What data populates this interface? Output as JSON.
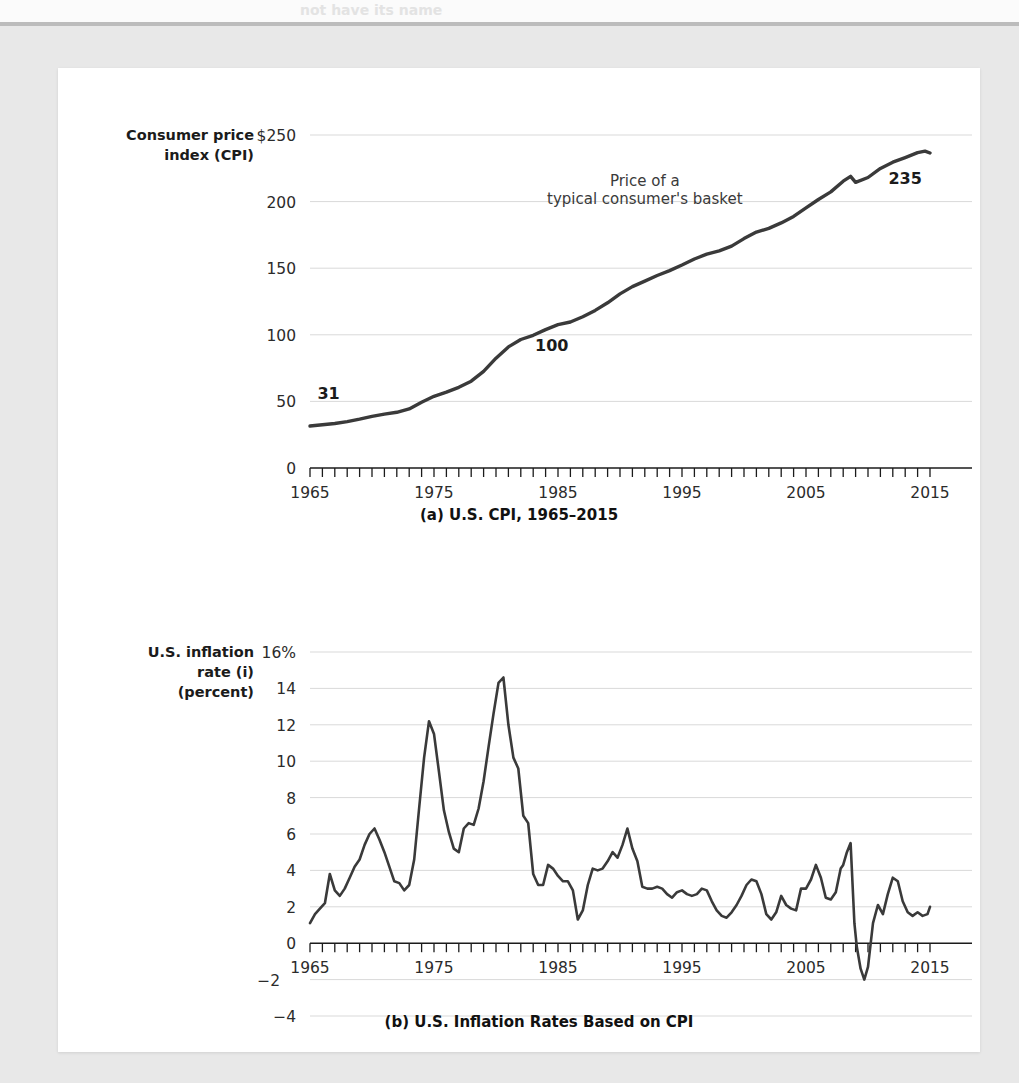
{
  "page": {
    "background_color": "#e8e8e8",
    "card_color": "#ffffff",
    "ghost_text_top": "not have its name",
    "ghost_text_right": "is even"
  },
  "chart_data": [
    {
      "type": "line",
      "id": "cpi",
      "title": "",
      "caption": "(a) U.S. CPI, 1965–2015",
      "ylabel_line1": "Consumer price",
      "ylabel_line2": "index (CPI)",
      "xlabel": "",
      "ytick_labels": [
        "$250",
        "200",
        "150",
        "100",
        "50",
        "0"
      ],
      "ytick_values": [
        250,
        200,
        150,
        100,
        50,
        0
      ],
      "xtick_labels": [
        "1965",
        "1975",
        "1985",
        "1995",
        "2005",
        "2015"
      ],
      "xtick_values": [
        1965,
        1975,
        1985,
        1995,
        2005,
        2015
      ],
      "xlim": [
        1965,
        2015
      ],
      "ylim": [
        0,
        250
      ],
      "grid": true,
      "legend": "none",
      "annotations": [
        {
          "text": "Price of a",
          "x": 1992,
          "y": 212
        },
        {
          "text": "typical consumer's basket",
          "x": 1992,
          "y": 198
        },
        {
          "text": "31",
          "x": 1966.5,
          "y": 52
        },
        {
          "text": "100",
          "x": 1984.5,
          "y": 88
        },
        {
          "text": "235",
          "x": 2013,
          "y": 213
        }
      ],
      "series_name": "U.S. Consumer Price Index",
      "x": [
        1965,
        1966,
        1967,
        1968,
        1969,
        1970,
        1971,
        1972,
        1973,
        1974,
        1975,
        1976,
        1977,
        1978,
        1979,
        1980,
        1981,
        1982,
        1983,
        1984,
        1985,
        1986,
        1987,
        1988,
        1989,
        1990,
        1991,
        1992,
        1993,
        1994,
        1995,
        1996,
        1997,
        1998,
        1999,
        2000,
        2001,
        2002,
        2003,
        2004,
        2005,
        2006,
        2007,
        2008,
        2008.6,
        2009,
        2010,
        2011,
        2012,
        2013,
        2014,
        2014.6,
        2015
      ],
      "values": [
        31.5,
        32.4,
        33.4,
        34.8,
        36.7,
        38.8,
        40.5,
        41.8,
        44.4,
        49.3,
        53.8,
        56.9,
        60.6,
        65.2,
        72.6,
        82.4,
        90.9,
        96.5,
        99.6,
        103.9,
        107.6,
        109.6,
        113.6,
        118.3,
        124.0,
        130.7,
        136.2,
        140.3,
        144.5,
        148.2,
        152.4,
        156.9,
        160.5,
        163.0,
        166.6,
        172.2,
        177.1,
        179.9,
        184.0,
        188.9,
        195.3,
        201.6,
        207.3,
        215.3,
        219.0,
        214.5,
        218.1,
        224.9,
        229.6,
        233.0,
        236.7,
        237.9,
        236.5
      ]
    },
    {
      "type": "line",
      "id": "inflation",
      "title": "",
      "caption": "(b) U.S. Inflation Rates Based on CPI",
      "ylabel_line1": "U.S. inflation",
      "ylabel_line2": "rate (i)",
      "ylabel_line3": "(percent)",
      "xlabel": "",
      "ytick_labels": [
        "16%",
        "14",
        "12",
        "10",
        "8",
        "6",
        "4",
        "2",
        "0",
        "−2",
        "−4"
      ],
      "ytick_values": [
        16,
        14,
        12,
        10,
        8,
        6,
        4,
        2,
        0,
        -2,
        -4
      ],
      "xtick_labels": [
        "1965",
        "1975",
        "1985",
        "1995",
        "2005",
        "2015"
      ],
      "xtick_values": [
        1965,
        1975,
        1985,
        1995,
        2005,
        2015
      ],
      "xlim": [
        1965,
        2015
      ],
      "ylim": [
        -4,
        16
      ],
      "grid": true,
      "legend": "none",
      "annotations": [],
      "series_name": "U.S. inflation rate (percent)",
      "x": [
        1965.0,
        1965.4,
        1965.8,
        1966.2,
        1966.6,
        1967.0,
        1967.4,
        1967.8,
        1968.2,
        1968.6,
        1969.0,
        1969.4,
        1969.8,
        1970.2,
        1970.6,
        1971.0,
        1971.4,
        1971.8,
        1972.2,
        1972.6,
        1973.0,
        1973.4,
        1973.8,
        1974.2,
        1974.6,
        1975.0,
        1975.4,
        1975.8,
        1976.2,
        1976.6,
        1977.0,
        1977.4,
        1977.8,
        1978.2,
        1978.6,
        1979.0,
        1979.4,
        1979.8,
        1980.2,
        1980.6,
        1981.0,
        1981.4,
        1981.8,
        1982.2,
        1982.6,
        1983.0,
        1983.4,
        1983.8,
        1984.2,
        1984.6,
        1985.0,
        1985.4,
        1985.8,
        1986.2,
        1986.6,
        1987.0,
        1987.4,
        1987.8,
        1988.2,
        1988.6,
        1989.0,
        1989.4,
        1989.8,
        1990.2,
        1990.6,
        1991.0,
        1991.4,
        1991.8,
        1992.2,
        1992.6,
        1993.0,
        1993.4,
        1993.8,
        1994.2,
        1994.6,
        1995.0,
        1995.4,
        1995.8,
        1996.2,
        1996.6,
        1997.0,
        1997.4,
        1997.8,
        1998.2,
        1998.6,
        1999.0,
        1999.4,
        1999.8,
        2000.2,
        2000.6,
        2001.0,
        2001.4,
        2001.8,
        2002.2,
        2002.6,
        2003.0,
        2003.4,
        2003.8,
        2004.2,
        2004.6,
        2005.0,
        2005.4,
        2005.8,
        2006.2,
        2006.6,
        2007.0,
        2007.4,
        2007.8,
        2008.0,
        2008.3,
        2008.6,
        2008.9,
        2009.1,
        2009.4,
        2009.7,
        2010.0,
        2010.4,
        2010.8,
        2011.2,
        2011.6,
        2012.0,
        2012.4,
        2012.8,
        2013.2,
        2013.6,
        2014.0,
        2014.4,
        2014.8,
        2015.0
      ],
      "values": [
        1.1,
        1.6,
        1.9,
        2.2,
        3.8,
        2.9,
        2.6,
        3.0,
        3.6,
        4.2,
        4.6,
        5.4,
        6.0,
        6.3,
        5.7,
        5.0,
        4.2,
        3.4,
        3.3,
        2.9,
        3.2,
        4.6,
        7.4,
        10.2,
        12.2,
        11.5,
        9.4,
        7.3,
        6.1,
        5.2,
        5.0,
        6.3,
        6.6,
        6.5,
        7.4,
        8.9,
        10.8,
        12.6,
        14.3,
        14.6,
        12.0,
        10.2,
        9.6,
        7.0,
        6.6,
        3.8,
        3.2,
        3.2,
        4.3,
        4.1,
        3.7,
        3.4,
        3.4,
        2.9,
        1.3,
        1.8,
        3.2,
        4.1,
        4.0,
        4.1,
        4.5,
        5.0,
        4.7,
        5.4,
        6.3,
        5.2,
        4.5,
        3.1,
        3.0,
        3.0,
        3.1,
        3.0,
        2.7,
        2.5,
        2.8,
        2.9,
        2.7,
        2.6,
        2.7,
        3.0,
        2.9,
        2.3,
        1.8,
        1.5,
        1.4,
        1.7,
        2.1,
        2.6,
        3.2,
        3.5,
        3.4,
        2.7,
        1.6,
        1.3,
        1.7,
        2.6,
        2.1,
        1.9,
        1.8,
        3.0,
        3.0,
        3.5,
        4.3,
        3.6,
        2.5,
        2.4,
        2.8,
        4.1,
        4.3,
        5.0,
        5.5,
        1.1,
        -0.2,
        -1.4,
        -2.0,
        -1.3,
        1.1,
        2.1,
        1.6,
        2.7,
        3.6,
        3.4,
        2.3,
        1.7,
        1.5,
        1.7,
        1.5,
        1.6,
        2.0,
        1.6,
        0.2
      ]
    }
  ]
}
